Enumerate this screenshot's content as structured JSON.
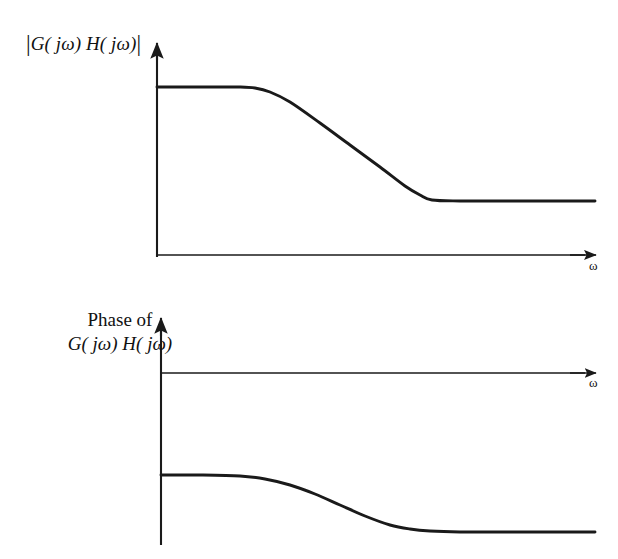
{
  "figure": {
    "background_color": "#ffffff",
    "line_color": "#1a1a1a"
  },
  "magnitude_plot": {
    "y_axis_label_prefix": "|",
    "y_axis_label_body": "G( jω) H( jω)",
    "y_axis_label_suffix": "|",
    "x_axis_label": "ω",
    "description": "Magnitude flat at low frequency, rolls off, then flattens at a lower level"
  },
  "phase_plot": {
    "y_axis_label_line1": "Phase of",
    "y_axis_label_line2": "G( jω) H( jω)",
    "x_axis_label": "ω",
    "description": "Phase flat negative at low frequency, decreases, then flattens at a more negative level"
  },
  "chart_data": {
    "type": "line",
    "panels": [
      {
        "name": "magnitude",
        "ylabel": "|G( jω) H( jω)|",
        "xlabel": "ω",
        "grid": false,
        "legend": null,
        "axis_origin_px": [
          157,
          255
        ],
        "x_axis_end_px": [
          600,
          255
        ],
        "y_axis_top_px": [
          157,
          43
        ],
        "xlim_px": [
          157,
          600
        ],
        "ylim_px": [
          43,
          255
        ],
        "series": [
          {
            "name": "magnitude",
            "x": [
              157,
              200,
              240,
              255,
              270,
              290,
              320,
              350,
              380,
              405,
              420,
              432,
              460,
              500,
              540,
              595
            ],
            "y": [
              87,
              87,
              87,
              88,
              92,
              102,
              123,
              145,
              167,
              186,
              195,
              200,
              201,
              201,
              201,
              201
            ],
            "high_level_y": 87,
            "low_level_y": 201,
            "corner_start_x": 250,
            "corner_end_x": 430
          }
        ]
      },
      {
        "name": "phase",
        "ylabel": "Phase of G( jω) H( jω)",
        "xlabel": "ω",
        "grid": false,
        "legend": null,
        "axis_origin_px": [
          161,
          373
        ],
        "x_axis_end_px": [
          600,
          373
        ],
        "y_axis_top_px": [
          161,
          318
        ],
        "y_axis_bottom_px": [
          161,
          545
        ],
        "xlim_px": [
          161,
          600
        ],
        "ylim_px": [
          318,
          545
        ],
        "series": [
          {
            "name": "phase",
            "x": [
              161,
              200,
              240,
              265,
              290,
              315,
              340,
              365,
              390,
              410,
              430,
              460,
              500,
              540,
              595
            ],
            "y": [
              475,
              475,
              476,
              479,
              485,
              494,
              505,
              516,
              525,
              529,
              531,
              532,
              532,
              532,
              532
            ],
            "high_level_y": 475,
            "low_level_y": 532,
            "corner_start_x": 250,
            "corner_end_x": 430
          }
        ]
      }
    ]
  }
}
